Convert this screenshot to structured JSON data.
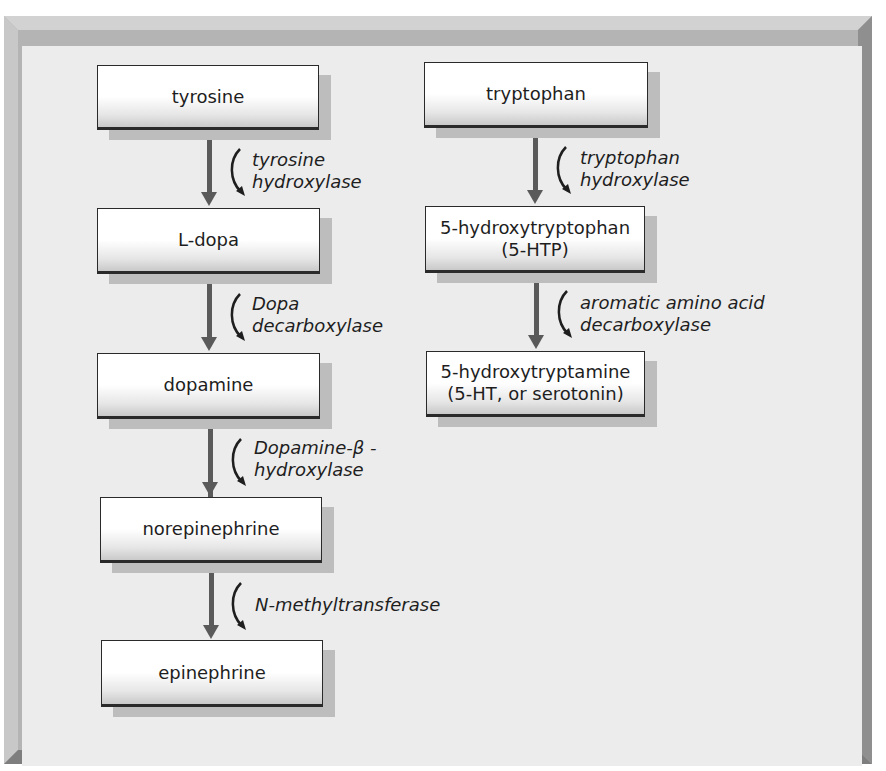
{
  "clipped_caption": "Figure . . . . . .",
  "pathways": {
    "catecholamine": {
      "nodes": [
        {
          "lines": [
            "tyrosine"
          ]
        },
        {
          "lines": [
            "L-dopa"
          ]
        },
        {
          "lines": [
            "dopamine"
          ]
        },
        {
          "lines": [
            "norepinephrine"
          ]
        },
        {
          "lines": [
            "epinephrine"
          ]
        }
      ],
      "enzymes": [
        {
          "lines": [
            "tyrosine",
            "hydroxylase"
          ]
        },
        {
          "lines": [
            "Dopa",
            "decarboxylase"
          ]
        },
        {
          "lines": [
            "Dopamine-β -",
            "hydroxylase"
          ]
        },
        {
          "lines": [
            "N-methyltransferase"
          ]
        }
      ]
    },
    "serotonin": {
      "nodes": [
        {
          "lines": [
            "tryptophan"
          ]
        },
        {
          "lines": [
            "5-hydroxytryptophan",
            "(5-HTP)"
          ]
        },
        {
          "lines": [
            "5-hydroxytryptamine",
            "(5-HT, or serotonin)"
          ]
        }
      ],
      "enzymes": [
        {
          "lines": [
            "tryptophan",
            "hydroxylase"
          ]
        },
        {
          "lines": [
            "aromatic amino acid",
            "decarboxylase"
          ]
        }
      ]
    }
  },
  "colors": {
    "arrow": "#5a5a5a",
    "panel_bg": "#ececec",
    "node_border": "#2a2a2a"
  }
}
